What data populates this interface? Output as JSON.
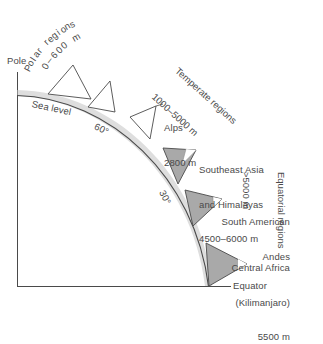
{
  "figure": {
    "axis": {
      "pole_label": "Pole",
      "equator_label": "Equator",
      "sea_level_label": "Sea level"
    },
    "latitude_markers": [
      {
        "label": "60°"
      },
      {
        "label": "30°"
      }
    ],
    "zones": [
      {
        "name": "Polar regions",
        "range": "0–600 m"
      },
      {
        "name": "Temperate regions",
        "range": "1000–5000 m"
      },
      {
        "name": "Equatorial regions",
        "range": ">5000 m"
      }
    ],
    "mountains": [
      {
        "name": "Alps",
        "line2": "",
        "elevation": "2800 m",
        "fill": "none"
      },
      {
        "name": "Southeast Asia",
        "line2": "and Himalayas",
        "elevation": "4500–6000 m",
        "fill": "gray"
      },
      {
        "name": "South American",
        "line2": "Andes",
        "elevation": "",
        "fill": "gray"
      },
      {
        "name": "Central Africa",
        "line2": "(Kilimanjaro)",
        "elevation": "5500 m",
        "fill": "gray"
      }
    ],
    "colors": {
      "stroke": "#4a4a4a",
      "mountain_fill": "#a9a9a9",
      "mountain_highlight": "#ffffff",
      "arc_shade": "#b5b5b5",
      "text": "#4a4a4a"
    }
  }
}
